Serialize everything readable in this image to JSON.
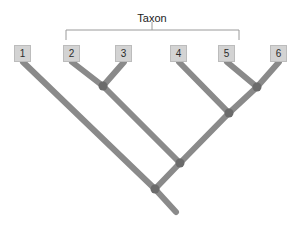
{
  "figure": {
    "type": "phylogenetic-tree",
    "background_color": "#ffffff",
    "branch_color": "#8a8a8a",
    "node_color": "#6b6b6b",
    "box_fill_color": "#d3d3d3",
    "box_border_color": "#bcbcbc",
    "bracket_color": "#9a9a9a",
    "text_color": "#1c1c1c"
  },
  "bracket": {
    "label": "Taxon",
    "label_x": 152,
    "label_y": 12,
    "left_x": 66,
    "right_x": 239,
    "top_y": 30,
    "end_y": 40,
    "tick_x": 152,
    "tick_y": 38,
    "spans_tips": [
      "2",
      "3",
      "4",
      "5"
    ]
  },
  "tips": [
    {
      "id": "1",
      "label": "1",
      "box_x": 14,
      "box_y": 45,
      "tip_x": 23,
      "tip_y": 62
    },
    {
      "id": "2",
      "label": "2",
      "box_x": 63,
      "box_y": 45,
      "tip_x": 72,
      "tip_y": 62
    },
    {
      "id": "3",
      "label": "3",
      "box_x": 115,
      "box_y": 45,
      "tip_x": 124,
      "tip_y": 62
    },
    {
      "id": "4",
      "label": "4",
      "box_x": 170,
      "box_y": 45,
      "tip_x": 179,
      "tip_y": 62
    },
    {
      "id": "5",
      "label": "5",
      "box_x": 218,
      "box_y": 45,
      "tip_x": 227,
      "tip_y": 62
    },
    {
      "id": "6",
      "label": "6",
      "box_x": 270,
      "box_y": 45,
      "tip_x": 279,
      "tip_y": 62
    }
  ],
  "nodes": [
    {
      "id": "n23",
      "x": 103,
      "y": 86,
      "children": [
        "2",
        "3"
      ]
    },
    {
      "id": "n56",
      "x": 257,
      "y": 87,
      "children": [
        "5",
        "6"
      ]
    },
    {
      "id": "n456",
      "x": 229,
      "y": 113,
      "children": [
        "4",
        "n56"
      ]
    },
    {
      "id": "n23456",
      "x": 180,
      "y": 163,
      "children": [
        "n23",
        "n456"
      ]
    },
    {
      "id": "root",
      "x": 155,
      "y": 189,
      "children": [
        "1",
        "n23456"
      ]
    }
  ],
  "root_tail": {
    "from_x": 155,
    "from_y": 189,
    "to_x": 176,
    "to_y": 212
  },
  "branch_width": 6,
  "node_radius": 4.5
}
